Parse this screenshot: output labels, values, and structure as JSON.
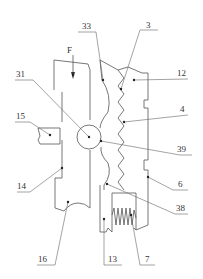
{
  "figure": {
    "type": "patent-mechanical-drawing",
    "force_label": "F",
    "labels": [
      {
        "id": "33",
        "text": "33"
      },
      {
        "id": "3",
        "text": "3"
      },
      {
        "id": "12",
        "text": "12"
      },
      {
        "id": "31",
        "text": "31"
      },
      {
        "id": "4",
        "text": "4"
      },
      {
        "id": "15",
        "text": "15"
      },
      {
        "id": "39",
        "text": "39"
      },
      {
        "id": "14",
        "text": "14"
      },
      {
        "id": "6",
        "text": "6"
      },
      {
        "id": "38",
        "text": "38"
      },
      {
        "id": "16",
        "text": "16"
      },
      {
        "id": "13",
        "text": "13"
      },
      {
        "id": "7",
        "text": "7"
      }
    ]
  }
}
